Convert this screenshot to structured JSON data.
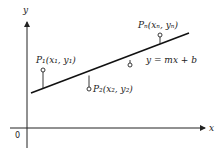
{
  "diagram": {
    "type": "least-squares-regression-line",
    "axes": {
      "x_label": "x",
      "y_label": "y",
      "origin_label": "0"
    },
    "line": {
      "equation": "y = mx + b"
    },
    "points": [
      {
        "label": "P₁(x₁, y₁)",
        "position": "above line"
      },
      {
        "label": "P₂(x₂, y₂)",
        "position": "below line"
      },
      {
        "label": "",
        "position": "below line"
      },
      {
        "label": "Pₙ(xₙ, yₙ)",
        "position": "above line"
      }
    ],
    "colors": {
      "ink": "#222222",
      "background": "#ffffff"
    }
  }
}
